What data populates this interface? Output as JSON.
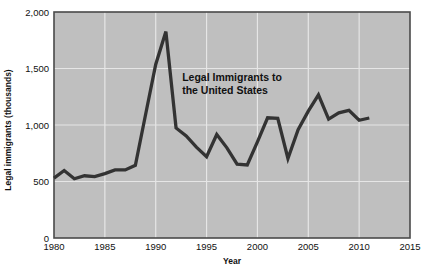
{
  "chart_data": {
    "type": "line",
    "title": "",
    "annotation": {
      "line1": "Legal Immigrants to",
      "line2": "the United States",
      "x_year": 1992.6,
      "y_value": 1390
    },
    "xlabel": "Year",
    "ylabel": "Legal immigrants (thousands)",
    "xlim": [
      1980,
      2015
    ],
    "ylim": [
      0,
      2000
    ],
    "x_ticks": [
      1980,
      1985,
      1990,
      1995,
      2000,
      2005,
      2010,
      2015
    ],
    "x_tick_labels": [
      "1980",
      "1985",
      "1990",
      "1995",
      "2000",
      "2005",
      "2010",
      "2015"
    ],
    "y_ticks": [
      0,
      500,
      1000,
      1500,
      2000
    ],
    "y_tick_labels": [
      "0",
      "500",
      "1,000",
      "1,500",
      "2,000"
    ],
    "grid": true,
    "grid_color": "#e6e6e6",
    "plot_background": "#bfbfbf",
    "line_color": "#333333",
    "series": [
      {
        "name": "Legal Immigrants to the United States",
        "x": [
          1980,
          1981,
          1982,
          1983,
          1984,
          1985,
          1986,
          1987,
          1988,
          1989,
          1990,
          1991,
          1992,
          1993,
          1994,
          1995,
          1996,
          1997,
          1998,
          1999,
          2000,
          2001,
          2002,
          2003,
          2004,
          2005,
          2006,
          2007,
          2008,
          2009,
          2010,
          2011
        ],
        "values": [
          530,
          597,
          524,
          551,
          544,
          570,
          602,
          602,
          643,
          1091,
          1536,
          1827,
          974,
          904,
          804,
          720,
          916,
          798,
          654,
          647,
          850,
          1064,
          1059,
          704,
          958,
          1122,
          1266,
          1052,
          1107,
          1130,
          1042,
          1062
        ]
      }
    ]
  },
  "axis": {
    "x_title": "Year",
    "y_title": "Legal immigrants (thousands)"
  }
}
